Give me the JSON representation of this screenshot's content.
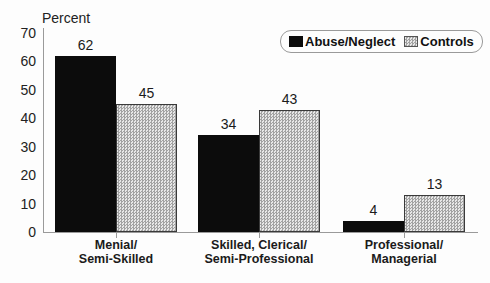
{
  "chart_data": {
    "type": "bar",
    "title": "",
    "ylabel": "Percent",
    "xlabel": "",
    "ylim": [
      0,
      70
    ],
    "yticks": [
      0,
      10,
      20,
      30,
      40,
      50,
      60,
      70
    ],
    "grid": false,
    "legend_position": "top-right",
    "categories": [
      [
        "Menial/",
        "Semi-Skilled"
      ],
      [
        "Skilled, Clerical/",
        "Semi-Professional"
      ],
      [
        "Professional/",
        "Managerial"
      ]
    ],
    "series": [
      {
        "name": "Abuse/Neglect",
        "values": [
          62,
          34,
          4
        ],
        "style": "solid-black",
        "color": "#0c0c0c"
      },
      {
        "name": "Controls",
        "values": [
          45,
          43,
          13
        ],
        "style": "checker-hatch",
        "color": "#e7e7e7"
      }
    ],
    "value_labels": true,
    "colors": {
      "axis": "#9a9a9a",
      "text": "#1b1b1b",
      "background": "#fdfdfd"
    }
  }
}
